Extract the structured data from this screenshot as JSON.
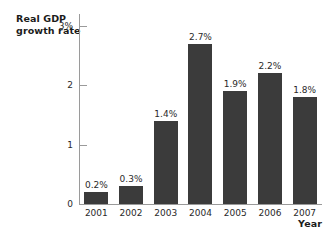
{
  "chart_data": {
    "type": "bar",
    "title": "",
    "ylabel": "Real GDP\ngrowth rate",
    "xlabel": "Year",
    "categories": [
      "2001",
      "2002",
      "2003",
      "2004",
      "2005",
      "2006",
      "2007"
    ],
    "values": [
      0.2,
      0.3,
      1.4,
      2.7,
      1.9,
      2.2,
      1.8
    ],
    "value_labels": [
      "0.2%",
      "0.3%",
      "1.4%",
      "2.7%",
      "1.9%",
      "2.2%",
      "1.8%"
    ],
    "ylim": [
      0,
      3.2
    ],
    "yticks": [
      0,
      1,
      2,
      3
    ],
    "ytick_labels": [
      "0",
      "1",
      "2",
      "3%"
    ],
    "grid": false,
    "legend": null,
    "bar_color": "#3b3b3b",
    "axis_color": "#9a9a9a",
    "text_color": "#2a2a2a",
    "background": "#ffffff"
  }
}
